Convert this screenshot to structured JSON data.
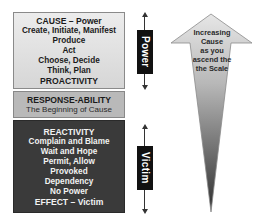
{
  "diagram": {
    "cause_box": {
      "title": "CAUSE – Power",
      "lines": [
        "Create, Initiate, Manifest",
        "Produce",
        "Act",
        "Choose, Decide",
        "Think, Plan"
      ],
      "footer": "PROACTIVITY"
    },
    "response_box": {
      "title": "RESPONSE-ABILITY",
      "subtitle": "The Beginning of Cause"
    },
    "reactivity_box": {
      "title": "REACTIVITY",
      "lines": [
        "Complain and Blame",
        "Wait and Hope",
        "Permit, Allow",
        "Provoked",
        "Dependency",
        "No Power"
      ],
      "footer": "EFFECT – Victim"
    },
    "markers": {
      "power": "Power",
      "victim": "Victim"
    },
    "scale_arrow": {
      "lines": [
        "Increasing",
        "Cause",
        "as you",
        "ascend the",
        "the Scale"
      ]
    },
    "colors": {
      "cause_bg": "#e2e2e2",
      "response_bg": "#b9b9b9",
      "reactivity_bg": "#3a3a3a",
      "marker_bg": "#111111"
    }
  }
}
